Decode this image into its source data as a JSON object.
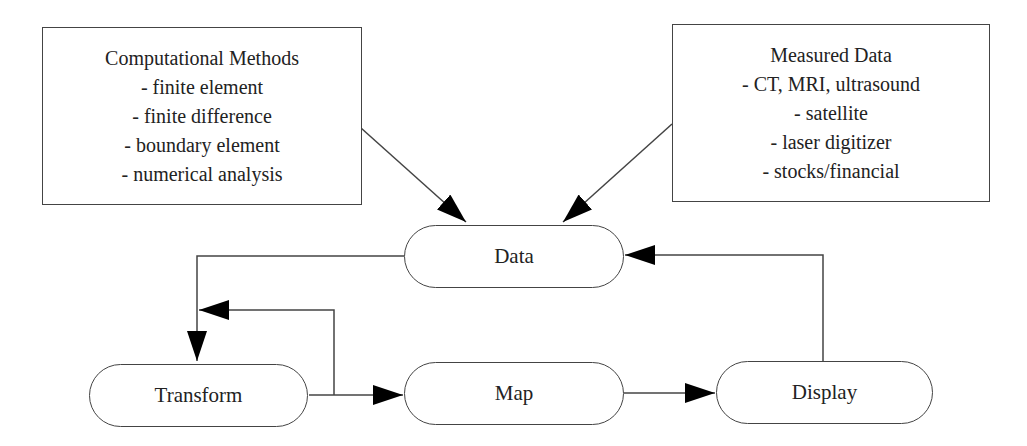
{
  "diagram": {
    "type": "flowchart",
    "sources": {
      "computational": {
        "title": "Computational Methods",
        "items": [
          "- finite element",
          "- finite difference",
          "- boundary element",
          "- numerical analysis"
        ]
      },
      "measured": {
        "title": "Measured Data",
        "items": [
          "- CT, MRI, ultrasound",
          "- satellite",
          "- laser digitizer",
          "- stocks/financial"
        ]
      }
    },
    "nodes": {
      "data": "Data",
      "transform": "Transform",
      "map": "Map",
      "display": "Display"
    },
    "edges": [
      {
        "from": "Computational Methods",
        "to": "Data"
      },
      {
        "from": "Measured Data",
        "to": "Data"
      },
      {
        "from": "Data",
        "to": "Transform"
      },
      {
        "from": "Transform",
        "to": "Map"
      },
      {
        "from": "Transform",
        "to": "Transform",
        "note": "feedback loop"
      },
      {
        "from": "Map",
        "to": "Display"
      },
      {
        "from": "Display",
        "to": "Data"
      }
    ],
    "colors": {
      "stroke": "#444444",
      "arrow": "#000000",
      "background": "#ffffff"
    }
  }
}
